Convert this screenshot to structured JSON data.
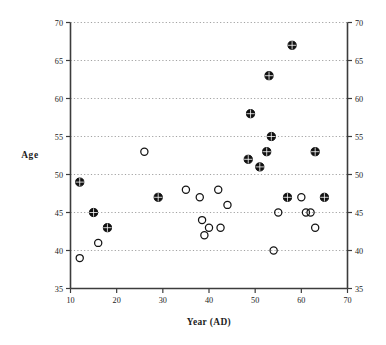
{
  "figure": {
    "background_color": "#ffffff",
    "axis_color": "#3c3c3c",
    "grid_color": "#7a7a7a",
    "marker_color": "#111111"
  },
  "chart_data": {
    "type": "scatter",
    "title": "",
    "xlabel": "Year  (AD)",
    "ylabel": "Age",
    "xlim": [
      10,
      70
    ],
    "ylim": [
      35,
      70
    ],
    "xticks": [
      10,
      20,
      30,
      40,
      50,
      60,
      70
    ],
    "yticks": [
      35,
      40,
      45,
      50,
      55,
      60,
      65,
      70
    ],
    "xtick_labels": [
      "10",
      "20",
      "30",
      "40",
      "50",
      "60",
      "70"
    ],
    "ytick_labels": [
      "35",
      "40",
      "45",
      "50",
      "55",
      "60",
      "65",
      "70"
    ],
    "grid": "horizontal-dotted",
    "mirrored_y_axis": true,
    "mirrored_y_tick_labels": [
      "35",
      "40",
      "45",
      "50",
      "55",
      "60",
      "65",
      "70"
    ],
    "legend": null,
    "series": [
      {
        "name": "filled",
        "marker": "crosshair-filled-circle",
        "points": [
          {
            "x": 12,
            "y": 49
          },
          {
            "x": 15,
            "y": 45
          },
          {
            "x": 18,
            "y": 43
          },
          {
            "x": 29,
            "y": 47
          },
          {
            "x": 48.5,
            "y": 52
          },
          {
            "x": 49,
            "y": 58
          },
          {
            "x": 51,
            "y": 51
          },
          {
            "x": 52.5,
            "y": 53
          },
          {
            "x": 53,
            "y": 63
          },
          {
            "x": 53.5,
            "y": 55
          },
          {
            "x": 57,
            "y": 47
          },
          {
            "x": 58,
            "y": 67
          },
          {
            "x": 63,
            "y": 53
          },
          {
            "x": 65,
            "y": 47
          }
        ]
      },
      {
        "name": "open",
        "marker": "open-circle",
        "points": [
          {
            "x": 12,
            "y": 39
          },
          {
            "x": 16,
            "y": 41
          },
          {
            "x": 26,
            "y": 53
          },
          {
            "x": 35,
            "y": 48
          },
          {
            "x": 38,
            "y": 47
          },
          {
            "x": 38.5,
            "y": 44
          },
          {
            "x": 39,
            "y": 42
          },
          {
            "x": 40,
            "y": 43
          },
          {
            "x": 42,
            "y": 48
          },
          {
            "x": 42.5,
            "y": 43
          },
          {
            "x": 44,
            "y": 46
          },
          {
            "x": 54,
            "y": 40
          },
          {
            "x": 55,
            "y": 45
          },
          {
            "x": 60,
            "y": 47
          },
          {
            "x": 61,
            "y": 45
          },
          {
            "x": 62,
            "y": 45
          },
          {
            "x": 63,
            "y": 43
          }
        ]
      }
    ]
  },
  "caption": {
    "text": ""
  }
}
